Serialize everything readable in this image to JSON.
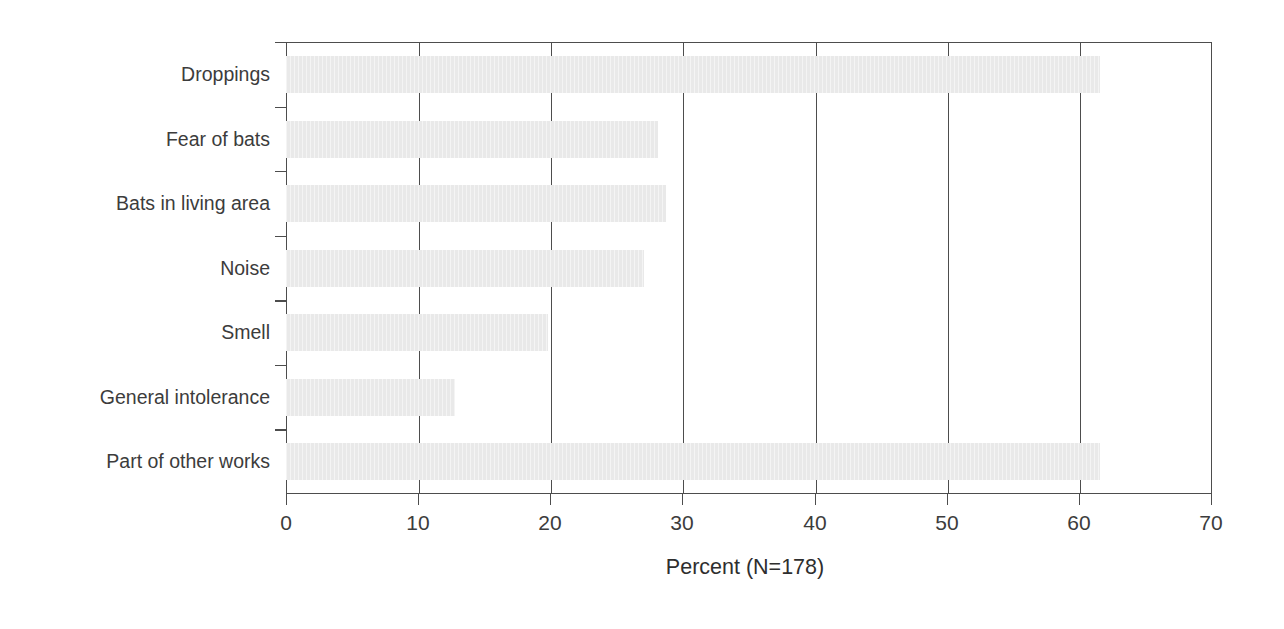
{
  "chart_data": {
    "type": "bar",
    "orientation": "horizontal",
    "title": "",
    "subtitle": "",
    "xlabel": "Percent (N=178)",
    "ylabel": "",
    "categories": [
      "Droppings",
      "Fear of bats",
      "Bats in living area",
      "Noise",
      "Smell",
      "General intolerance",
      "Part of other works"
    ],
    "values": [
      61.5,
      28.1,
      28.7,
      27.1,
      19.8,
      12.8,
      61.5
    ],
    "xlim": [
      0,
      70
    ],
    "xticks": [
      0,
      10,
      20,
      30,
      40,
      50,
      60,
      70
    ],
    "xtick_labels": [
      "0",
      "10",
      "20",
      "30",
      "40",
      "50",
      "60",
      "70"
    ],
    "grid": "vertical",
    "legend": null,
    "annotations": [],
    "colors": {
      "bar_fill": "#e9e9e9",
      "axis": "#4d4d4d",
      "text": "#3c3c3c",
      "background": "#ffffff"
    }
  }
}
